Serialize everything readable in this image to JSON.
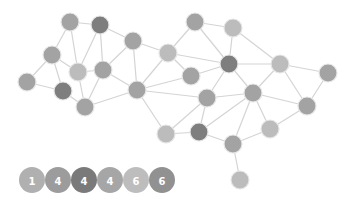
{
  "colors": {
    "edge": "#d4d4d4",
    "light": "#bcbcbc",
    "medium": "#a3a3a3",
    "dark": "#7e7e7e"
  },
  "graph": {
    "node_radius": 9,
    "nodes": [
      {
        "id": "n1",
        "x": 70,
        "y": 22,
        "tone": "medium"
      },
      {
        "id": "n2",
        "x": 100,
        "y": 25,
        "tone": "dark"
      },
      {
        "id": "n3",
        "x": 133,
        "y": 41,
        "tone": "medium"
      },
      {
        "id": "n4",
        "x": 52,
        "y": 55,
        "tone": "medium"
      },
      {
        "id": "n5",
        "x": 78,
        "y": 72,
        "tone": "light"
      },
      {
        "id": "n6",
        "x": 103,
        "y": 70,
        "tone": "medium"
      },
      {
        "id": "n7",
        "x": 27,
        "y": 82,
        "tone": "medium"
      },
      {
        "id": "n8",
        "x": 63,
        "y": 91,
        "tone": "dark"
      },
      {
        "id": "n9",
        "x": 85,
        "y": 107,
        "tone": "medium"
      },
      {
        "id": "n10",
        "x": 137,
        "y": 90,
        "tone": "medium"
      },
      {
        "id": "n11",
        "x": 168,
        "y": 53,
        "tone": "light"
      },
      {
        "id": "n12",
        "x": 195,
        "y": 22,
        "tone": "medium"
      },
      {
        "id": "n13",
        "x": 233,
        "y": 28,
        "tone": "light"
      },
      {
        "id": "n14",
        "x": 229,
        "y": 64,
        "tone": "dark"
      },
      {
        "id": "n15",
        "x": 191,
        "y": 76,
        "tone": "medium"
      },
      {
        "id": "n16",
        "x": 280,
        "y": 64,
        "tone": "light"
      },
      {
        "id": "n17",
        "x": 328,
        "y": 73,
        "tone": "medium"
      },
      {
        "id": "n18",
        "x": 207,
        "y": 98,
        "tone": "medium"
      },
      {
        "id": "n19",
        "x": 253,
        "y": 93,
        "tone": "medium"
      },
      {
        "id": "n20",
        "x": 307,
        "y": 106,
        "tone": "medium"
      },
      {
        "id": "n21",
        "x": 166,
        "y": 134,
        "tone": "light"
      },
      {
        "id": "n22",
        "x": 199,
        "y": 132,
        "tone": "dark"
      },
      {
        "id": "n23",
        "x": 233,
        "y": 144,
        "tone": "medium"
      },
      {
        "id": "n24",
        "x": 270,
        "y": 129,
        "tone": "light"
      },
      {
        "id": "n25",
        "x": 240,
        "y": 180,
        "tone": "light"
      }
    ],
    "edges": [
      [
        "n1",
        "n2"
      ],
      [
        "n1",
        "n4"
      ],
      [
        "n1",
        "n5"
      ],
      [
        "n2",
        "n5"
      ],
      [
        "n2",
        "n6"
      ],
      [
        "n2",
        "n3"
      ],
      [
        "n4",
        "n7"
      ],
      [
        "n4",
        "n5"
      ],
      [
        "n4",
        "n8"
      ],
      [
        "n5",
        "n6"
      ],
      [
        "n5",
        "n9"
      ],
      [
        "n6",
        "n9"
      ],
      [
        "n6",
        "n3"
      ],
      [
        "n6",
        "n10"
      ],
      [
        "n7",
        "n8"
      ],
      [
        "n8",
        "n9"
      ],
      [
        "n9",
        "n10"
      ],
      [
        "n3",
        "n10"
      ],
      [
        "n3",
        "n11"
      ],
      [
        "n11",
        "n10"
      ],
      [
        "n11",
        "n14"
      ],
      [
        "n11",
        "n15"
      ],
      [
        "n11",
        "n12"
      ],
      [
        "n15",
        "n14"
      ],
      [
        "n10",
        "n15"
      ],
      [
        "n10",
        "n18"
      ],
      [
        "n18",
        "n14"
      ],
      [
        "n12",
        "n14"
      ],
      [
        "n12",
        "n13"
      ],
      [
        "n13",
        "n14"
      ],
      [
        "n13",
        "n16"
      ],
      [
        "n14",
        "n16"
      ],
      [
        "n14",
        "n19"
      ],
      [
        "n16",
        "n19"
      ],
      [
        "n16",
        "n17"
      ],
      [
        "n16",
        "n20"
      ],
      [
        "n17",
        "n20"
      ],
      [
        "n19",
        "n20"
      ],
      [
        "n19",
        "n18"
      ],
      [
        "n19",
        "n22"
      ],
      [
        "n19",
        "n23"
      ],
      [
        "n19",
        "n24"
      ],
      [
        "n20",
        "n24"
      ],
      [
        "n18",
        "n22"
      ],
      [
        "n18",
        "n21"
      ],
      [
        "n10",
        "n21"
      ],
      [
        "n21",
        "n22"
      ],
      [
        "n22",
        "n23"
      ],
      [
        "n23",
        "n24"
      ],
      [
        "n23",
        "n25"
      ]
    ]
  },
  "legend": {
    "y": 180,
    "radius": 13,
    "items": [
      {
        "label": "1",
        "x": 32,
        "color": "#b0b0b0"
      },
      {
        "label": "4",
        "x": 58,
        "color": "#9c9c9c"
      },
      {
        "label": "4",
        "x": 84,
        "color": "#7a7a7a"
      },
      {
        "label": "4",
        "x": 110,
        "color": "#a6a6a6"
      },
      {
        "label": "6",
        "x": 136,
        "color": "#bdbdbd"
      },
      {
        "label": "6",
        "x": 162,
        "color": "#919191"
      }
    ]
  }
}
